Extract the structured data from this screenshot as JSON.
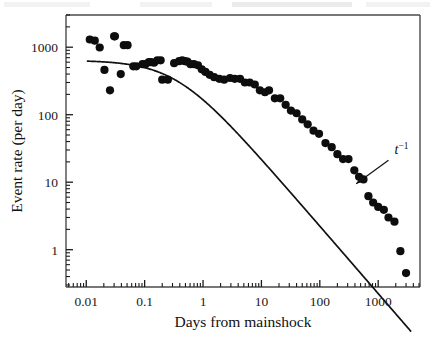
{
  "figure": {
    "alt_description": "Log-log plot of earthquake aftershock event rate versus days from mainshock",
    "background_color": "#ffffff",
    "ink_color": "#111111",
    "axis_color": "#4a4a4a"
  },
  "chart_data": {
    "type": "scatter",
    "title": "",
    "subtitle": "",
    "xlabel": "Days from mainshock",
    "ylabel": "Event rate (per day)",
    "xscale": "log",
    "yscale": "log",
    "xlim": [
      0.0045,
      5200
    ],
    "ylim": [
      0.28,
      3000
    ],
    "grid": false,
    "legend": null,
    "xticks": [
      0.01,
      0.1,
      1,
      10,
      100,
      1000
    ],
    "xticklabels": [
      "0.01",
      "0.1",
      "1",
      "10",
      "100",
      "1000"
    ],
    "yticks": [
      1,
      10,
      100,
      1000
    ],
    "yticklabels": [
      "1",
      "10",
      "100",
      "1000"
    ],
    "minor_ticks": true,
    "series": [
      {
        "name": "Aftershock event rate",
        "marker": "filled-circle",
        "marker_color": "#0d0d0d",
        "marker_size_px": 4.1,
        "x": [
          0.0115,
          0.014,
          0.017,
          0.0205,
          0.0255,
          0.03,
          0.031,
          0.039,
          0.044,
          0.051,
          0.064,
          0.072,
          0.092,
          0.103,
          0.118,
          0.128,
          0.145,
          0.165,
          0.188,
          0.2,
          0.25,
          0.32,
          0.39,
          0.44,
          0.49,
          0.54,
          0.61,
          0.7,
          0.82,
          0.95,
          1.1,
          1.3,
          1.55,
          1.9,
          2.3,
          2.9,
          3.5,
          4.3,
          5.2,
          6.3,
          7.7,
          9.4,
          11.5,
          13.5,
          17.0,
          21.0,
          26.0,
          32.0,
          40.0,
          50.0,
          62.0,
          78.0,
          97.0,
          125.0,
          160.0,
          200.0,
          250.0,
          310.0,
          390.0,
          470.0,
          560.0,
          680.0,
          820.0,
          1000.0,
          1250.0,
          1500.0,
          1900.0,
          2400.0,
          3000.0
        ],
        "y": [
          1300,
          1250,
          990,
          460,
          230,
          1450,
          1450,
          400,
          1070,
          1070,
          520,
          520,
          560,
          560,
          600,
          600,
          590,
          640,
          640,
          330,
          330,
          580,
          620,
          640,
          620,
          610,
          560,
          560,
          540,
          470,
          430,
          390,
          360,
          340,
          330,
          350,
          340,
          340,
          300,
          300,
          280,
          230,
          215,
          230,
          175,
          175,
          140,
          115,
          105,
          85,
          72,
          58,
          52,
          38,
          33,
          26,
          22,
          22,
          15,
          12,
          11,
          6.2,
          5.0,
          4.3,
          3.9,
          3.0,
          2.6,
          0.95,
          0.45
        ]
      }
    ],
    "fit_curve": {
      "name": "Omori-law fit",
      "description": "Flat at early times, rolling over to a t^-1 power-law decay",
      "color": "#111111",
      "linewidth_px": 1.7,
      "plateau_rate": 640,
      "rollover_time_days": 0.35,
      "power_law_exponent": -1.0,
      "x_start": 0.0105,
      "x_end": 3600
    },
    "annotations": [
      {
        "name": "power-law-exponent-label",
        "text": "t",
        "superscript": "−1",
        "x_data": 1900,
        "y_data": 26,
        "arrow_to_x_data": 420,
        "arrow_to_y_data": 9.5
      }
    ]
  },
  "labels": {
    "y_axis_title": "Event rate (per day)",
    "x_axis_title": "Days from mainshock",
    "x_tick_labels": [
      "0.01",
      "0.1",
      "1",
      "10",
      "100",
      "1000"
    ],
    "y_tick_labels": [
      "1000",
      "100",
      "10",
      "1"
    ],
    "annotation_base": "t",
    "annotation_exponent": "−1"
  },
  "scan_artifacts": {
    "top_band_note": "faint grey scan smudges along the top page edge",
    "watermark_note": "very faint residual text behind the plot area"
  }
}
